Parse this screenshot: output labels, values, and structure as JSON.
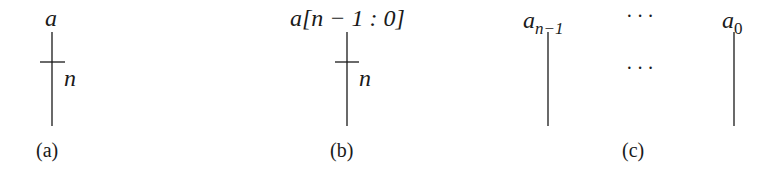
{
  "diagram": {
    "panels": [
      {
        "id": "a",
        "caption": "(a)",
        "signal_label": "a",
        "bus_width_label": "n",
        "type": "bus-with-width-tick"
      },
      {
        "id": "b",
        "caption": "(b)",
        "signal_label_prefix": "a",
        "signal_label_range": "[n − 1 : 0]",
        "bus_width_label": "n",
        "type": "bus-with-width-tick"
      },
      {
        "id": "c",
        "caption": "(c)",
        "left_wire_label": "a",
        "left_wire_subscript": "n−1",
        "right_wire_label": "a",
        "right_wire_subscript": "0",
        "ellipsis_top": "···",
        "ellipsis_middle": "···",
        "type": "individual-wires"
      }
    ],
    "colors": {
      "line": "#1a1a1a",
      "background": "#ffffff"
    }
  }
}
